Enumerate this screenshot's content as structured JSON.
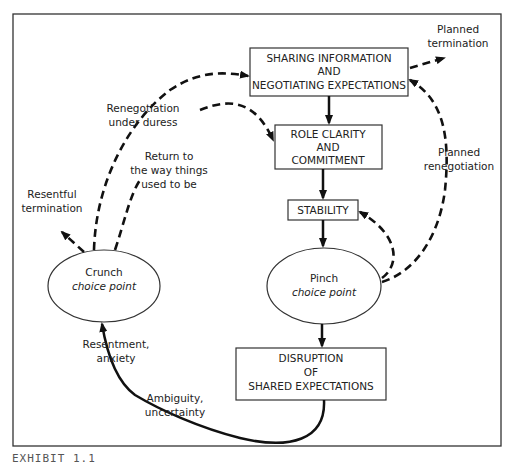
{
  "diagram": {
    "boxes": {
      "sharing": [
        "SHARING INFORMATION",
        "AND",
        "NEGOTIATING  EXPECTATIONS"
      ],
      "role": [
        "ROLE CLARITY",
        "AND",
        "COMMITMENT"
      ],
      "stability": [
        "STABILITY"
      ],
      "disruption": [
        "DISRUPTION",
        "OF",
        "SHARED EXPECTATIONS"
      ]
    },
    "ellipses": {
      "crunch": {
        "title": "Crunch",
        "subtitle": "choice point"
      },
      "pinch": {
        "title": "Pinch",
        "subtitle": "choice point"
      }
    },
    "labels": {
      "planned_termination": [
        "Planned",
        "termination"
      ],
      "renegotiation_duress": [
        "Renegotiation",
        "under duress"
      ],
      "return_to": [
        "Return to",
        "the way things",
        "used to be"
      ],
      "planned_renegotiation": [
        "Planned",
        "renegotiation"
      ],
      "resentful_termination": [
        "Resentful",
        "termination"
      ],
      "resentment": [
        "Resentment,",
        "anxiety"
      ],
      "ambiguity": [
        "Ambiguity,",
        "uncertainty"
      ]
    }
  },
  "caption": "EXHIBIT 1.1"
}
